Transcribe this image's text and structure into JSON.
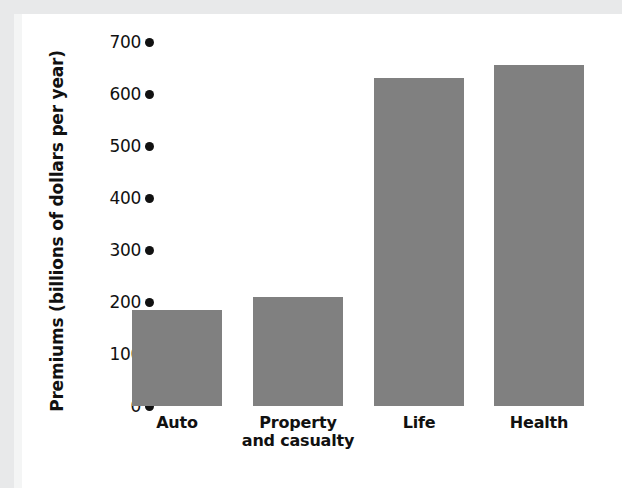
{
  "chart_data": {
    "type": "bar",
    "title": "",
    "xlabel": "",
    "ylabel": "Premiums (billions of dollars per year)",
    "categories": [
      "Auto",
      "Property and casualty",
      "Life",
      "Health"
    ],
    "category_lines": [
      [
        "Auto"
      ],
      [
        "Property",
        "and casualty"
      ],
      [
        "Life"
      ],
      [
        "Health"
      ]
    ],
    "values": [
      185,
      210,
      630,
      655
    ],
    "ylim": [
      0,
      700
    ],
    "yticks": [
      0,
      100,
      200,
      300,
      400,
      500,
      600,
      700
    ],
    "ytick_labels": [
      "0",
      "100",
      "200",
      "300",
      "400",
      "500",
      "600",
      "700"
    ],
    "grid": false,
    "legend": "none",
    "bar_color": "#808080",
    "text_color": "#111111",
    "tick_marker": "filled-circle"
  }
}
